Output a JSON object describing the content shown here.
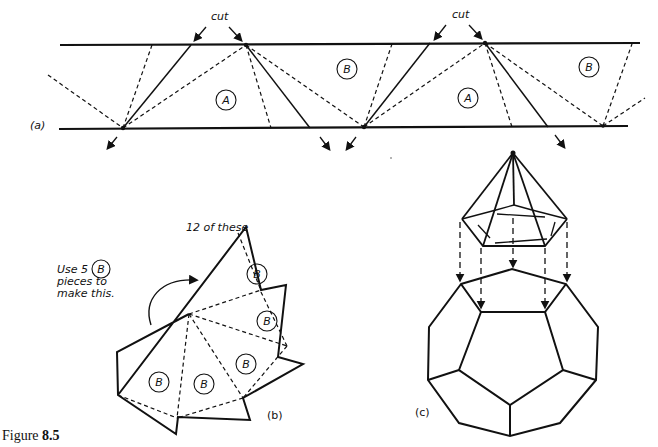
{
  "figure": {
    "caption_prefix": "Figure ",
    "caption_number": "8.5"
  },
  "panel_a": {
    "label": "(a)",
    "cut_label_1": "cut",
    "cut_label_2": "cut",
    "region_labels": [
      "A",
      "B",
      "A",
      "B"
    ]
  },
  "panel_b": {
    "label": "(b)",
    "count_note": "12 of these",
    "instruction_line1": "Use 5",
    "instruction_circle": "B",
    "instruction_line2": "pieces to",
    "instruction_line3": "make this.",
    "piece_labels": [
      "B",
      "B",
      "B",
      "B",
      "B"
    ]
  },
  "panel_c": {
    "label": "(c)"
  }
}
